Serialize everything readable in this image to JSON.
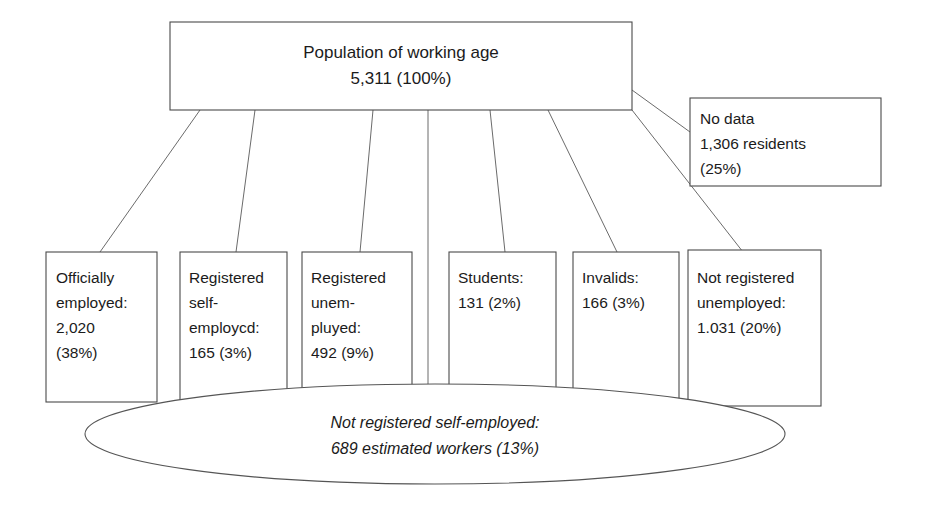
{
  "diagram": {
    "title_node": {
      "name": "population-of-working-age",
      "lines": [
        "Population of working age",
        "5,311 (100%)"
      ],
      "label": "Population of working age",
      "value": "5,311 (100%)",
      "count": 5311,
      "percent": 100
    },
    "side_node": {
      "name": "no-data",
      "lines": [
        "No data",
        "1,306 residents",
        "(25%)"
      ],
      "label": "No data",
      "value": "1,306 residents",
      "percent_text": "(25%)",
      "count": 1306,
      "percent": 25
    },
    "ellipse_node": {
      "name": "not-registered-self-employed",
      "lines": [
        "Not registered self-employed:",
        "689 estimated workers (13%)"
      ],
      "label": "Not registered self-employed:",
      "value": "689 estimated workers (13%)",
      "count": 689,
      "percent": 13
    },
    "leaf_nodes": [
      {
        "name": "officially-employed",
        "lines": [
          "Officially",
          "employed:",
          "2,020",
          "(38%)"
        ],
        "count": 2020,
        "percent": 38
      },
      {
        "name": "registered-self-employed",
        "lines": [
          "Registered",
          "self-",
          "employcd:",
          "165 (3%)"
        ],
        "count": 165,
        "percent": 3
      },
      {
        "name": "registered-unemployed",
        "lines": [
          "Registered",
          "unem-",
          "pluyed:",
          "492 (9%)"
        ],
        "count": 492,
        "percent": 9
      },
      {
        "name": "students",
        "lines": [
          "Students:",
          "131 (2%)"
        ],
        "count": 131,
        "percent": 2
      },
      {
        "name": "invalids",
        "lines": [
          "Invalids:",
          "166 (3%)"
        ],
        "count": 166,
        "percent": 3
      },
      {
        "name": "not-registered-unemployed",
        "lines": [
          "Not registered",
          "unemployed:",
          "1.031 (20%)"
        ],
        "count": 1031,
        "percent": 20
      }
    ]
  },
  "colors": {
    "background": "#ffffff",
    "box_stroke": "#4a4a4a",
    "connector_stroke": "#6b6b6b",
    "text": "#1b1b1b"
  }
}
